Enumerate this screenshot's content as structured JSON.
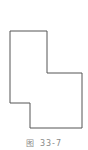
{
  "figure": {
    "shape": {
      "type": "polygon",
      "points": [
        [
          10,
          31
        ],
        [
          47,
          31
        ],
        [
          47,
          73
        ],
        [
          82,
          73
        ],
        [
          82,
          128
        ],
        [
          30,
          128
        ],
        [
          30,
          103
        ],
        [
          10,
          103
        ]
      ],
      "stroke": "#555555",
      "fill": "none",
      "stroke_width": 1
    },
    "caption": {
      "prefix": "图",
      "number": "33-7"
    }
  }
}
